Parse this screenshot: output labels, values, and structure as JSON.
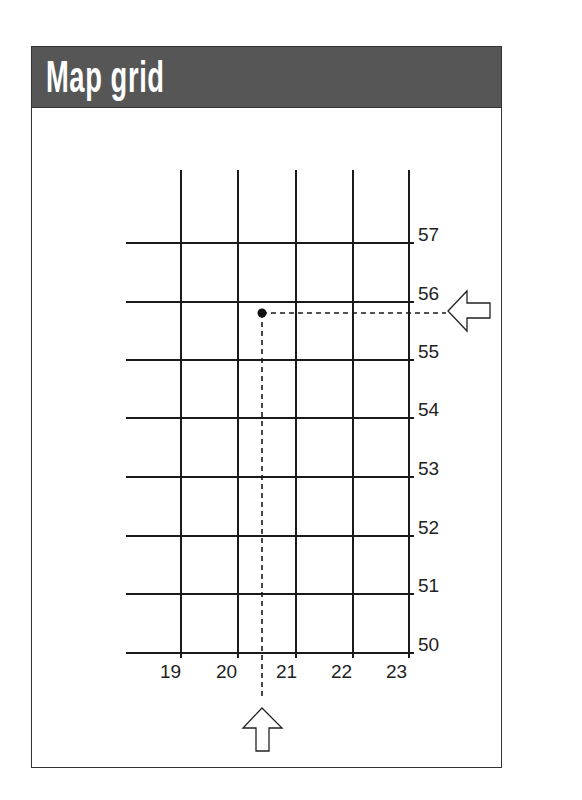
{
  "header": {
    "title": "Map grid"
  },
  "colors": {
    "header_bg": "#565656",
    "line": "#1a1a1a",
    "title_text": "#ffffff"
  },
  "grid": {
    "eastings": [
      "19",
      "20",
      "21",
      "22",
      "23"
    ],
    "northings": [
      "57",
      "56",
      "55",
      "54",
      "53",
      "52",
      "51",
      "50"
    ]
  },
  "point": {
    "easting": 20.4,
    "northing": 55.8,
    "label": "grid reference point"
  },
  "arrows": [
    {
      "name": "right-arrow",
      "direction": "left",
      "points_to": "northing 55.8"
    },
    {
      "name": "bottom-arrow",
      "direction": "up",
      "points_to": "easting 20.4"
    }
  ]
}
